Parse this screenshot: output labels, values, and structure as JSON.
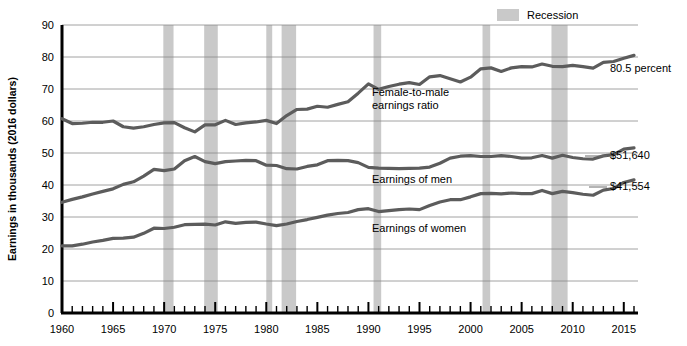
{
  "chart_data": {
    "type": "line",
    "title": "",
    "xlabel": "",
    "ylabel": "Earnings in thousands (2016 dollars)",
    "xlim": [
      1960,
      2016
    ],
    "ylim": [
      0,
      90
    ],
    "yticks": [
      0,
      10,
      20,
      30,
      40,
      50,
      60,
      70,
      80,
      90
    ],
    "xticks_labeled": [
      1960,
      1965,
      1970,
      1975,
      1980,
      1985,
      1990,
      1995,
      2000,
      2005,
      2010,
      2015
    ],
    "xtick_interval_minor": 1,
    "grid": "horizontal",
    "legend_position": "top-right",
    "legend": [
      {
        "label": "Recession",
        "color": "#c9c9c9",
        "kind": "band"
      }
    ],
    "x": [
      1960,
      1961,
      1962,
      1963,
      1964,
      1965,
      1966,
      1967,
      1968,
      1969,
      1970,
      1971,
      1972,
      1973,
      1974,
      1975,
      1976,
      1977,
      1978,
      1979,
      1980,
      1981,
      1982,
      1983,
      1984,
      1985,
      1986,
      1987,
      1988,
      1989,
      1990,
      1991,
      1992,
      1993,
      1994,
      1995,
      1996,
      1997,
      1998,
      1999,
      2000,
      2001,
      2002,
      2003,
      2004,
      2005,
      2006,
      2007,
      2008,
      2009,
      2010,
      2011,
      2012,
      2013,
      2014,
      2015,
      2016
    ],
    "series": [
      {
        "name": "Female-to-male earnings ratio",
        "unit": "percent",
        "color": "#5c5c5c",
        "end_label": "80.5 percent",
        "inline_label": "Female-to-male earnings ratio",
        "values": [
          60.7,
          59.2,
          59.3,
          59.6,
          59.6,
          60.0,
          58.2,
          57.8,
          58.2,
          58.9,
          59.4,
          59.5,
          57.9,
          56.6,
          58.8,
          58.8,
          60.2,
          58.9,
          59.4,
          59.7,
          60.2,
          59.2,
          61.7,
          63.6,
          63.7,
          64.6,
          64.3,
          65.2,
          66.0,
          68.7,
          71.6,
          69.9,
          70.8,
          71.5,
          72.0,
          71.4,
          73.8,
          74.2,
          73.2,
          72.2,
          73.7,
          76.3,
          76.6,
          75.5,
          76.6,
          77.0,
          76.9,
          77.8,
          77.1,
          77.0,
          77.4,
          77.0,
          76.5,
          78.3,
          78.6,
          79.6,
          80.5
        ]
      },
      {
        "name": "Earnings of men",
        "unit": "thousands of 2016 dollars",
        "color": "#5c5c5c",
        "end_label": "$51,640",
        "inline_label": "Earnings of men",
        "values": [
          34.6,
          35.5,
          36.3,
          37.2,
          38.0,
          38.8,
          40.2,
          41.0,
          42.8,
          44.9,
          44.5,
          45.0,
          47.6,
          48.9,
          47.3,
          46.7,
          47.3,
          47.5,
          47.7,
          47.6,
          46.2,
          46.1,
          45.1,
          45.0,
          45.8,
          46.3,
          47.6,
          47.7,
          47.6,
          47.0,
          45.5,
          45.3,
          45.2,
          45.1,
          45.2,
          45.3,
          45.6,
          46.8,
          48.4,
          49.0,
          49.2,
          48.9,
          48.9,
          49.2,
          48.9,
          48.4,
          48.5,
          49.2,
          48.4,
          49.3,
          48.6,
          48.2,
          48.1,
          49.1,
          49.5,
          51.2,
          51.6
        ]
      },
      {
        "name": "Earnings of women",
        "unit": "thousands of 2016 dollars",
        "color": "#5c5c5c",
        "end_label": "$41,554",
        "inline_label": "Earnings of women",
        "values": [
          21.0,
          21.0,
          21.5,
          22.2,
          22.7,
          23.3,
          23.4,
          23.7,
          24.9,
          26.5,
          26.4,
          26.8,
          27.6,
          27.7,
          27.8,
          27.5,
          28.5,
          28.0,
          28.3,
          28.4,
          27.8,
          27.3,
          27.8,
          28.6,
          29.2,
          29.9,
          30.6,
          31.1,
          31.4,
          32.3,
          32.6,
          31.7,
          32.0,
          32.3,
          32.5,
          32.3,
          33.6,
          34.7,
          35.4,
          35.4,
          36.3,
          37.3,
          37.4,
          37.2,
          37.5,
          37.3,
          37.3,
          38.3,
          37.3,
          38.0,
          37.6,
          37.1,
          36.8,
          38.4,
          38.9,
          40.8,
          41.6
        ]
      }
    ],
    "recessions": [
      {
        "start": 1969.92,
        "end": 1970.92
      },
      {
        "start": 1973.92,
        "end": 1975.25
      },
      {
        "start": 1980.0,
        "end": 1980.58
      },
      {
        "start": 1981.5,
        "end": 1982.92
      },
      {
        "start": 1990.5,
        "end": 1991.25
      },
      {
        "start": 2001.17,
        "end": 2001.92
      },
      {
        "start": 2007.92,
        "end": 2009.5
      }
    ],
    "annotations": [
      {
        "name": "ratio-end-label",
        "text": "80.5 percent"
      },
      {
        "name": "men-end-label",
        "text": "$51,640"
      },
      {
        "name": "women-end-label",
        "text": "$41,554"
      },
      {
        "name": "ratio-inline-label-line1",
        "text": "Female-to-male"
      },
      {
        "name": "ratio-inline-label-line2",
        "text": "earnings ratio"
      },
      {
        "name": "men-inline-label",
        "text": "Earnings of men"
      },
      {
        "name": "women-inline-label",
        "text": "Earnings of women"
      }
    ],
    "colors": {
      "line": "#5c5c5c",
      "recession_band": "#c9c9c9",
      "gridline": "#8a8a8a",
      "axis": "#000000",
      "background": "#ffffff"
    }
  },
  "legend": {
    "recession_label": "Recession"
  },
  "axis": {
    "y_title": "Earnings in thousands (2016 dollars)",
    "y_ticks": [
      "90",
      "80",
      "70",
      "60",
      "50",
      "40",
      "30",
      "20",
      "10",
      "0"
    ],
    "x_ticks": [
      "1960",
      "1965",
      "1970",
      "1975",
      "1980",
      "1985",
      "1990",
      "1995",
      "2000",
      "2005",
      "2010",
      "2015"
    ]
  },
  "labels": {
    "ratio_end": "80.5 percent",
    "men_end": "$51,640",
    "women_end": "$41,554",
    "ratio_inline_1": "Female-to-male",
    "ratio_inline_2": "earnings ratio",
    "men_inline": "Earnings of men",
    "women_inline": "Earnings of women"
  }
}
